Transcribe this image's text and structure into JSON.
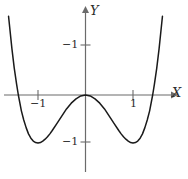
{
  "figure": {
    "background_color": "#ffffff",
    "curve_color": "#1a1a1a",
    "axis_color": "#6b6b6b",
    "text_color": "#2b2b2b",
    "axis_labels": {
      "x": "X",
      "y": "Y"
    },
    "tick_labels": {
      "x_negative_one": "−1",
      "x_positive_one": "1",
      "y_upper": "−1",
      "y_lower": "−1"
    }
  },
  "chart_data": {
    "type": "line",
    "title": "",
    "xlabel": "X",
    "ylabel": "Y",
    "xlim": [
      -1.8,
      1.8
    ],
    "ylim": [
      -1.75,
      1.6
    ],
    "grid": false,
    "legend": false,
    "equation": "y = x^4 - 2x^2",
    "x_ticks": [
      -1,
      1
    ],
    "x_tick_labels": [
      "−1",
      "1"
    ],
    "y_ticks": [
      -1,
      1
    ],
    "y_tick_labels": [
      "−1",
      "−1"
    ],
    "annotations": {
      "local_maximum": [
        0,
        0
      ],
      "minima": [
        [
          -1,
          -1
        ],
        [
          1,
          -1
        ]
      ],
      "x_intercepts": [
        -1.414,
        0,
        1.414
      ]
    },
    "series": [
      {
        "name": "y = x^4 - 2x^2",
        "x": [
          -1.62,
          -1.55,
          -1.5,
          -1.45,
          -1.414,
          -1.35,
          -1.3,
          -1.25,
          -1.2,
          -1.15,
          -1.1,
          -1.05,
          -1.0,
          -0.95,
          -0.9,
          -0.85,
          -0.8,
          -0.75,
          -0.7,
          -0.6,
          -0.5,
          -0.4,
          -0.3,
          -0.2,
          -0.1,
          0.0,
          0.1,
          0.2,
          0.3,
          0.4,
          0.5,
          0.6,
          0.7,
          0.75,
          0.8,
          0.85,
          0.9,
          0.95,
          1.0,
          1.05,
          1.1,
          1.15,
          1.2,
          1.25,
          1.3,
          1.35,
          1.414,
          1.45,
          1.5,
          1.55,
          1.62
        ],
        "y": [
          1.64,
          0.97,
          0.56,
          0.22,
          0.0,
          -0.33,
          -0.52,
          -0.68,
          -0.81,
          -0.9,
          -0.96,
          -0.99,
          -1.0,
          -0.99,
          -0.96,
          -0.92,
          -0.87,
          -0.81,
          -0.74,
          -0.59,
          -0.44,
          -0.29,
          -0.17,
          -0.08,
          -0.02,
          0.0,
          -0.02,
          -0.08,
          -0.17,
          -0.29,
          -0.44,
          -0.59,
          -0.74,
          -0.81,
          -0.87,
          -0.92,
          -0.96,
          -0.99,
          -1.0,
          -0.99,
          -0.96,
          -0.9,
          -0.81,
          -0.68,
          -0.52,
          -0.33,
          0.0,
          0.22,
          0.56,
          0.97,
          1.64
        ]
      }
    ]
  }
}
